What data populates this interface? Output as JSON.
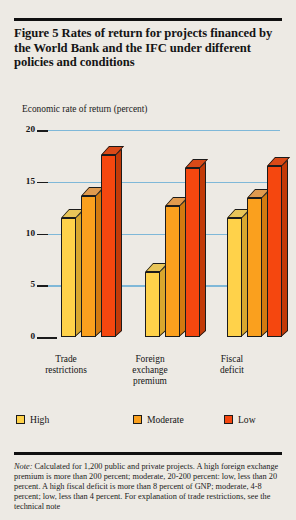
{
  "figure": {
    "title": "Figure 5  Rates of return for projects financed by the World Bank and the IFC under different policies and conditions",
    "axis_label": "Economic rate of return (percent)",
    "note_prefix": "Note:",
    "note": " Calculated for 1,200 public and private projects. A high foreign exchange premium is more than 200 percent; moderate, 20-200 percent: low, less than 20 percent. A high fiscal deficit is more than 8 percent of GNP; moderate, 4-8 percent; low, less than 4 percent. For explanation of trade restrictions, see the technical note"
  },
  "colors": {
    "background": "#edeae4",
    "gridline": "#7fb8d8",
    "axis": "#1b1b1b",
    "high_front": "#ffd24a",
    "high_top": "#e8c558",
    "high_side": "#d8a72e",
    "moderate_front": "#faa01e",
    "moderate_top": "#e09a4e",
    "moderate_side": "#d2７a10",
    "low_front": "#f5470f",
    "low_top": "#d94a18",
    "low_side": "#c23a08"
  },
  "chart_data": {
    "type": "bar",
    "title": "Figure 5  Rates of return for projects financed by the World Bank and the IFC under different policies and conditions",
    "xlabel": "",
    "ylabel": "Economic rate of return (percent)",
    "ylim": [
      0,
      20
    ],
    "yticks": [
      0,
      5,
      10,
      15,
      20
    ],
    "ytick_labels": [
      "0",
      "5",
      "10",
      "15",
      "20"
    ],
    "grid": true,
    "legend_position": "bottom",
    "categories": [
      "Trade restrictions",
      "Foreign exchange premium",
      "Fiscal deficit"
    ],
    "series": [
      {
        "name": "High",
        "values": [
          11.5,
          6.3,
          11.5
        ]
      },
      {
        "name": "Moderate",
        "values": [
          13.6,
          12.7,
          13.4
        ]
      },
      {
        "name": "Low",
        "values": [
          17.6,
          16.3,
          16.5
        ]
      }
    ]
  },
  "group_labels": [
    {
      "line1": "Trade",
      "line2": "restrictions",
      "line3": ""
    },
    {
      "line1": "Foreign",
      "line2": "exchange",
      "line3": "premium"
    },
    {
      "line1": "Fiscal",
      "line2": "deficit",
      "line3": ""
    }
  ],
  "legend": {
    "items": [
      {
        "label": "High"
      },
      {
        "label": "Moderate"
      },
      {
        "label": "Low"
      }
    ]
  }
}
